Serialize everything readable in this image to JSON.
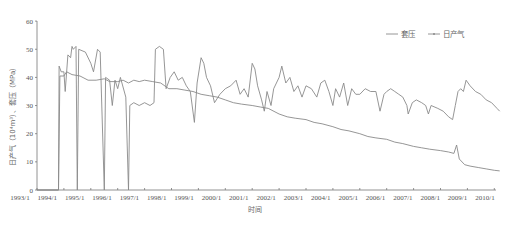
{
  "chart_data": {
    "type": "line",
    "title": "",
    "xlabel": "时间",
    "ylabel": "日产气（10⁴m³）、套压（MPa）",
    "ylim": [
      0,
      60
    ],
    "yticks": [
      0,
      10,
      20,
      30,
      40,
      50,
      60
    ],
    "xticks": [
      "1993/1",
      "1994/1",
      "1995/1",
      "1996/1",
      "1997/1",
      "1998/1",
      "1999/1",
      "2000/1",
      "2001/1",
      "2002/1",
      "2003/1",
      "2004/1",
      "2005/1",
      "2006/1",
      "2007/1",
      "2008/1",
      "2009/1",
      "2010/1"
    ],
    "grid": false,
    "legend_position": "top-right",
    "series": [
      {
        "name": "套压",
        "color": "#8a8a8a",
        "marker": "none",
        "points": [
          [
            1993.0,
            0
          ],
          [
            1993.8,
            0
          ],
          [
            1993.85,
            40.5
          ],
          [
            1994.0,
            40.5
          ],
          [
            1994.1,
            42
          ],
          [
            1994.3,
            41
          ],
          [
            1994.6,
            40.5
          ],
          [
            1994.9,
            39
          ],
          [
            1995.2,
            39
          ],
          [
            1995.5,
            39.5
          ],
          [
            1995.7,
            38.5
          ],
          [
            1995.9,
            38.5
          ],
          [
            1996.0,
            38.5
          ],
          [
            1996.2,
            39
          ],
          [
            1996.4,
            38
          ],
          [
            1996.6,
            39
          ],
          [
            1996.8,
            38.5
          ],
          [
            1997.0,
            39
          ],
          [
            1997.3,
            38.5
          ],
          [
            1997.6,
            38
          ],
          [
            1997.9,
            36
          ],
          [
            1998.2,
            36
          ],
          [
            1998.5,
            35.5
          ],
          [
            1998.8,
            35
          ],
          [
            1999.1,
            34
          ],
          [
            1999.4,
            33.5
          ],
          [
            1999.7,
            33
          ],
          [
            2000.0,
            32
          ],
          [
            2000.3,
            31
          ],
          [
            2000.6,
            30.5
          ],
          [
            2001.0,
            30
          ],
          [
            2001.3,
            29.5
          ],
          [
            2001.6,
            29
          ],
          [
            2002.0,
            27
          ],
          [
            2002.3,
            26
          ],
          [
            2002.6,
            25.5
          ],
          [
            2003.0,
            25
          ],
          [
            2003.3,
            24
          ],
          [
            2003.6,
            23.5
          ],
          [
            2004.0,
            22.5
          ],
          [
            2004.3,
            21.5
          ],
          [
            2004.6,
            21
          ],
          [
            2005.0,
            20
          ],
          [
            2005.3,
            19
          ],
          [
            2005.6,
            18.5
          ],
          [
            2006.0,
            18
          ],
          [
            2006.3,
            17
          ],
          [
            2006.6,
            16.5
          ],
          [
            2007.0,
            15.5
          ],
          [
            2007.3,
            15
          ],
          [
            2007.6,
            14.5
          ],
          [
            2008.0,
            14
          ],
          [
            2008.3,
            13.5
          ],
          [
            2008.5,
            13
          ],
          [
            2008.6,
            16
          ],
          [
            2008.7,
            11
          ],
          [
            2008.9,
            9
          ],
          [
            2009.1,
            8.5
          ],
          [
            2009.4,
            8
          ],
          [
            2009.7,
            7.5
          ],
          [
            2010.0,
            7
          ],
          [
            2010.2,
            6.8
          ]
        ]
      },
      {
        "name": "日产气",
        "color": "#8a8a8a",
        "marker": "dot",
        "points": [
          [
            1993.0,
            0
          ],
          [
            1993.8,
            0
          ],
          [
            1993.82,
            44
          ],
          [
            1993.9,
            42
          ],
          [
            1994.0,
            42
          ],
          [
            1994.05,
            35
          ],
          [
            1994.15,
            48
          ],
          [
            1994.25,
            47
          ],
          [
            1994.3,
            51
          ],
          [
            1994.35,
            50
          ],
          [
            1994.45,
            51
          ],
          [
            1994.5,
            0
          ],
          [
            1994.55,
            50
          ],
          [
            1994.8,
            49
          ],
          [
            1995.0,
            45
          ],
          [
            1995.1,
            42
          ],
          [
            1995.25,
            50
          ],
          [
            1995.35,
            49
          ],
          [
            1995.5,
            0
          ],
          [
            1995.55,
            40
          ],
          [
            1995.7,
            39
          ],
          [
            1995.8,
            30
          ],
          [
            1995.9,
            39
          ],
          [
            1996.0,
            36
          ],
          [
            1996.1,
            40
          ],
          [
            1996.3,
            33
          ],
          [
            1996.4,
            0
          ],
          [
            1996.45,
            30
          ],
          [
            1996.6,
            31
          ],
          [
            1996.8,
            30
          ],
          [
            1997.0,
            31
          ],
          [
            1997.2,
            30
          ],
          [
            1997.35,
            31
          ],
          [
            1997.4,
            50
          ],
          [
            1997.55,
            51
          ],
          [
            1997.7,
            50
          ],
          [
            1997.8,
            36
          ],
          [
            1997.95,
            40
          ],
          [
            1998.1,
            42
          ],
          [
            1998.25,
            39
          ],
          [
            1998.4,
            40
          ],
          [
            1998.55,
            37
          ],
          [
            1998.7,
            35
          ],
          [
            1998.85,
            24
          ],
          [
            1998.95,
            38
          ],
          [
            1999.1,
            47
          ],
          [
            1999.2,
            45
          ],
          [
            1999.3,
            40
          ],
          [
            1999.45,
            37
          ],
          [
            1999.6,
            31
          ],
          [
            1999.8,
            34
          ],
          [
            2000.0,
            36
          ],
          [
            2000.2,
            37
          ],
          [
            2000.4,
            39
          ],
          [
            2000.55,
            34
          ],
          [
            2000.7,
            36
          ],
          [
            2000.85,
            33
          ],
          [
            2001.0,
            45
          ],
          [
            2001.1,
            43
          ],
          [
            2001.2,
            37
          ],
          [
            2001.35,
            32
          ],
          [
            2001.45,
            28
          ],
          [
            2001.55,
            35
          ],
          [
            2001.7,
            30
          ],
          [
            2001.8,
            36
          ],
          [
            2002.0,
            40
          ],
          [
            2002.1,
            44
          ],
          [
            2002.25,
            38
          ],
          [
            2002.4,
            40
          ],
          [
            2002.55,
            35
          ],
          [
            2002.7,
            37
          ],
          [
            2002.85,
            33
          ],
          [
            2003.0,
            37
          ],
          [
            2003.2,
            36
          ],
          [
            2003.4,
            33
          ],
          [
            2003.55,
            38
          ],
          [
            2003.7,
            39
          ],
          [
            2003.85,
            35
          ],
          [
            2004.0,
            30
          ],
          [
            2004.1,
            36
          ],
          [
            2004.25,
            33
          ],
          [
            2004.4,
            38
          ],
          [
            2004.55,
            30
          ],
          [
            2004.7,
            36
          ],
          [
            2004.85,
            34
          ],
          [
            2005.0,
            34
          ],
          [
            2005.2,
            36
          ],
          [
            2005.4,
            35
          ],
          [
            2005.6,
            35
          ],
          [
            2005.75,
            28
          ],
          [
            2005.9,
            34
          ],
          [
            2006.0,
            35
          ],
          [
            2006.15,
            36
          ],
          [
            2006.3,
            35
          ],
          [
            2006.45,
            34
          ],
          [
            2006.6,
            33
          ],
          [
            2006.75,
            30
          ],
          [
            2006.8,
            27
          ],
          [
            2006.95,
            31
          ],
          [
            2007.1,
            32
          ],
          [
            2007.3,
            31
          ],
          [
            2007.45,
            30
          ],
          [
            2007.55,
            27
          ],
          [
            2007.65,
            30
          ],
          [
            2007.9,
            29
          ],
          [
            2008.1,
            28
          ],
          [
            2008.3,
            26
          ],
          [
            2008.45,
            25
          ],
          [
            2008.55,
            30
          ],
          [
            2008.65,
            35
          ],
          [
            2008.75,
            36
          ],
          [
            2008.85,
            35
          ],
          [
            2008.95,
            39
          ],
          [
            2009.1,
            37
          ],
          [
            2009.3,
            35
          ],
          [
            2009.5,
            34
          ],
          [
            2009.7,
            32
          ],
          [
            2009.9,
            31
          ],
          [
            2010.1,
            29
          ],
          [
            2010.2,
            28
          ]
        ]
      }
    ]
  },
  "legend": {
    "items": [
      {
        "label": "套压"
      },
      {
        "label": "日产气"
      }
    ]
  },
  "axes": {
    "xlabel": "时间",
    "ylabel": "日产气（10⁴m³）、套压（MPa）"
  }
}
